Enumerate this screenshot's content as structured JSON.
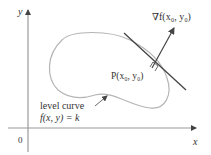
{
  "diagram": {
    "type": "level-curve-gradient",
    "axes": {
      "x_label": "x",
      "y_label": "y",
      "origin_label": "0",
      "color": "#9a9a9a"
    },
    "level_curve": {
      "label_line1": "level curve",
      "label_line2": "f(x, y) = k",
      "color": "#b5b5b5"
    },
    "point": {
      "label": "P(x₀, y₀)"
    },
    "gradient": {
      "label": "∇f(x₀, y₀)",
      "color": "#444444"
    },
    "tangent_line": {
      "color": "#444444"
    },
    "text_color": "#333333"
  }
}
